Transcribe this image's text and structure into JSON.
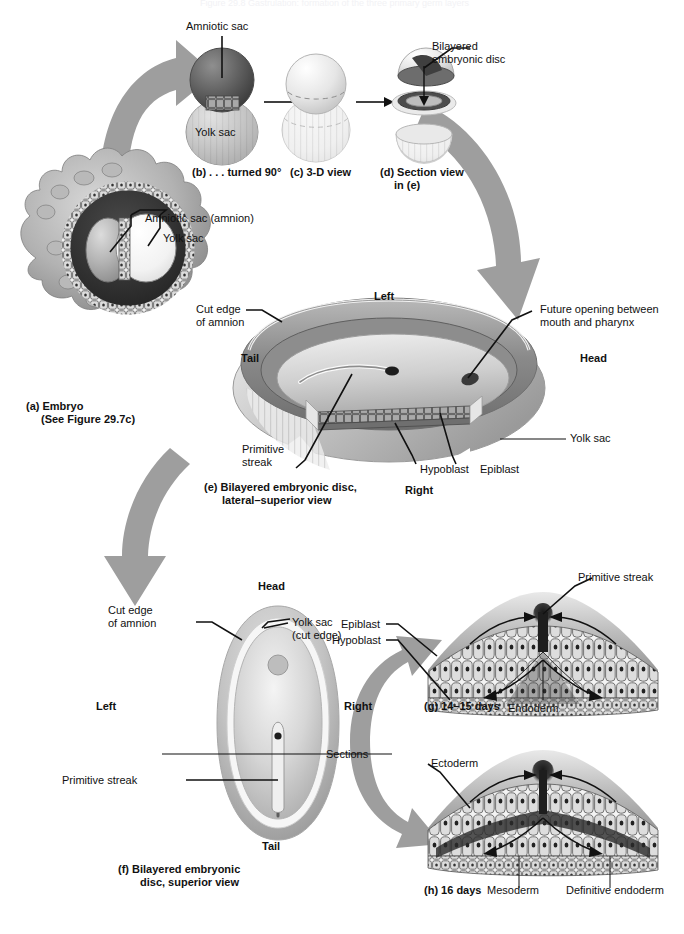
{
  "figure": {
    "title_ghost": "Figure 29.8 Gastrulation: formation of the three primary germ layers",
    "arrow_color": "#9e9e9e",
    "line_color": "#111111",
    "background": "#ffffff"
  },
  "panel_a": {
    "caption_line1": "(a) Embryo",
    "caption_line2": "(See Figure 29.7c)",
    "labels": [
      {
        "text": "Amniotic sac (amnion)"
      },
      {
        "text": "Yolk sac"
      }
    ]
  },
  "panel_b": {
    "caption": "(b) . . . turned 90°",
    "labels": [
      {
        "text": "Amniotic sac"
      },
      {
        "text": "Yolk sac"
      }
    ]
  },
  "panel_c": {
    "caption": "(c) 3-D view"
  },
  "panel_d": {
    "caption_line1": "(d) Section view",
    "caption_line2": "in (e)",
    "labels": [
      {
        "text": "Bilayered"
      },
      {
        "text": "embryonic disc"
      }
    ]
  },
  "panel_e": {
    "caption_line1": "(e) Bilayered embryonic disc,",
    "caption_line2": "lateral–superior view",
    "orientation": {
      "left": "Left",
      "right": "Right",
      "head": "Head",
      "tail": "Tail"
    },
    "labels": {
      "cut_edge_1": "Cut edge",
      "cut_edge_2": "of amnion",
      "future_opening_1": "Future opening between",
      "future_opening_2": "mouth and pharynx",
      "yolk_sac": "Yolk sac",
      "primitive_1": "Primitive",
      "primitive_2": "streak",
      "hypoblast": "Hypoblast",
      "epiblast": "Epiblast"
    }
  },
  "panel_f": {
    "caption_line1": "(f) Bilayered embryonic",
    "caption_line2": "disc, superior view",
    "orientation": {
      "head": "Head",
      "tail": "Tail",
      "left": "Left",
      "right": "Right"
    },
    "labels": {
      "cut_edge_1": "Cut edge",
      "cut_edge_2": "of amnion",
      "yolk_sac_1": "Yolk sac",
      "yolk_sac_2": "(cut edge)",
      "sections": "Sections",
      "primitive_streak": "Primitive streak"
    }
  },
  "panel_g": {
    "caption": "(g) 14–15 days",
    "labels": {
      "epiblast": "Epiblast",
      "hypoblast": "Hypoblast",
      "primitive_streak": "Primitive streak",
      "endoderm": "Endoderm"
    }
  },
  "panel_h": {
    "caption": "(h) 16 days",
    "labels": {
      "ectoderm": "Ectoderm",
      "mesoderm": "Mesoderm",
      "definitive_endoderm": "Definitive endoderm"
    }
  }
}
